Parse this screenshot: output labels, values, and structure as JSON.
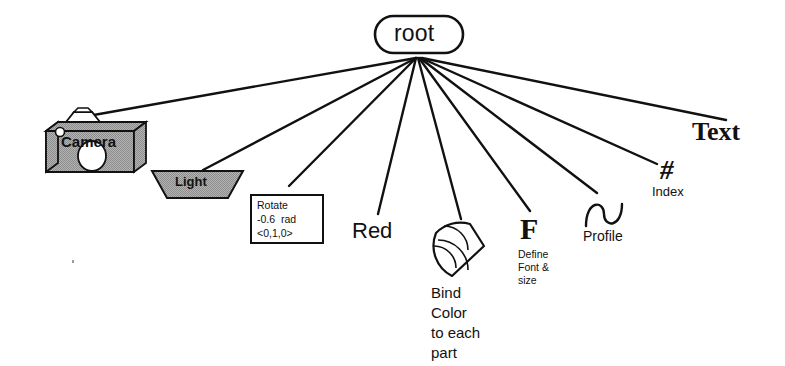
{
  "diagram": {
    "root": {
      "label": "root",
      "shape": "stadium"
    },
    "colors": {
      "stroke": "#111111",
      "fill_gray": "#a9a9a9",
      "background": "#ffffff",
      "text": "#111111"
    },
    "nodes": [
      {
        "id": "camera",
        "label": "Camera",
        "icon": "camera-icon",
        "kind": "shape-3d-box"
      },
      {
        "id": "light",
        "label": "Light",
        "icon": "light-trapezoid-icon",
        "kind": "trapezoid"
      },
      {
        "id": "rotate",
        "icon": "rotate-box-icon",
        "kind": "rect-box",
        "lines": [
          "Rotate",
          "-0.6  rad",
          "<0,1,0>"
        ]
      },
      {
        "id": "red",
        "label": "Red",
        "icon": "color-label-icon",
        "kind": "text"
      },
      {
        "id": "bind-color",
        "icon": "fan-wedge-icon",
        "kind": "wedge",
        "lines": [
          "Bind",
          "Color",
          "to each",
          "part"
        ]
      },
      {
        "id": "font",
        "label": "F",
        "icon": "font-glyph-icon",
        "kind": "glyph",
        "lines": [
          "Define",
          "Font &",
          "size"
        ]
      },
      {
        "id": "profile",
        "label": "Profile",
        "icon": "sine-wave-icon",
        "kind": "curve"
      },
      {
        "id": "index",
        "label": "#",
        "caption": "Index",
        "icon": "hash-glyph-icon",
        "kind": "glyph"
      },
      {
        "id": "text",
        "label": "Text",
        "icon": "text-label-icon",
        "kind": "text"
      }
    ],
    "edges": [
      {
        "from": "root",
        "to": "camera"
      },
      {
        "from": "root",
        "to": "light"
      },
      {
        "from": "root",
        "to": "rotate"
      },
      {
        "from": "root",
        "to": "red"
      },
      {
        "from": "root",
        "to": "bind-color"
      },
      {
        "from": "root",
        "to": "font"
      },
      {
        "from": "root",
        "to": "profile"
      },
      {
        "from": "root",
        "to": "index"
      },
      {
        "from": "root",
        "to": "text"
      }
    ]
  }
}
